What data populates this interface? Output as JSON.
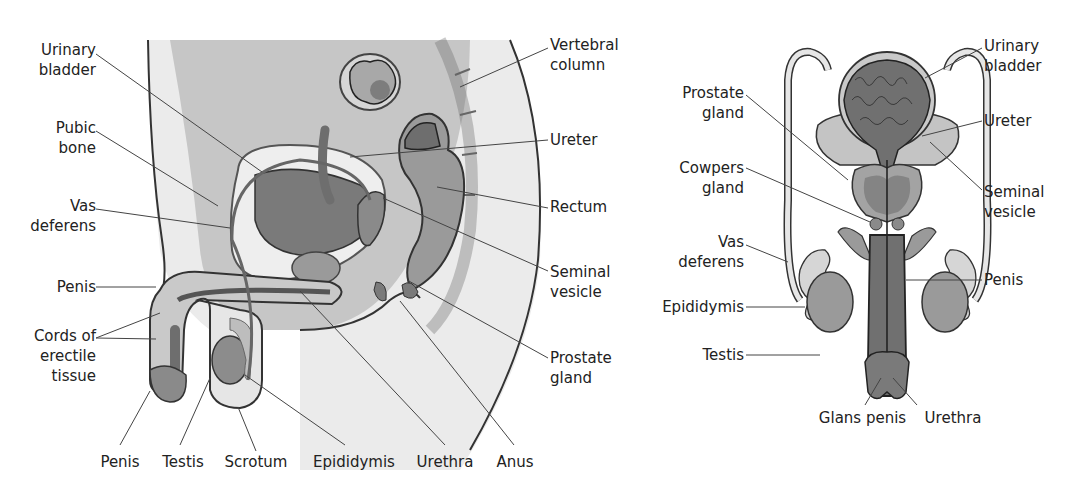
{
  "diagram": {
    "colors": {
      "line": "#333333",
      "light": "#ebebeb",
      "mid": "#bdbdbd",
      "dark": "#8a8a8a",
      "darker": "#6e6e6e"
    },
    "side_view": {
      "labels": {
        "urinary_bladder": "Urinary\nbladder",
        "pubic_bone": "Pubic\nbone",
        "vas_deferens": "Vas\ndeferens",
        "penis_left": "Penis",
        "cords_erectile": "Cords of\nerectile\ntissue",
        "vertebral_column": "Vertebral\ncolumn",
        "ureter": "Ureter",
        "rectum": "Rectum",
        "seminal_vesicle": "Seminal\nvesicle",
        "prostate_gland": "Prostate\ngland",
        "penis_bottom": "Penis",
        "testis": "Testis",
        "scrotum": "Scrotum",
        "epididymis": "Epididymis",
        "urethra": "Urethra",
        "anus": "Anus"
      }
    },
    "front_view": {
      "labels": {
        "urinary_bladder": "Urinary\nbladder",
        "prostate_gland": "Prostate\ngland",
        "ureter": "Ureter",
        "cowpers_gland": "Cowpers\ngland",
        "seminal_vesicle": "Seminal\nvesicle",
        "vas_deferens": "Vas\ndeferens",
        "penis": "Penis",
        "epididymis": "Epididymis",
        "testis": "Testis",
        "glans_penis": "Glans penis",
        "urethra": "Urethra"
      }
    }
  }
}
